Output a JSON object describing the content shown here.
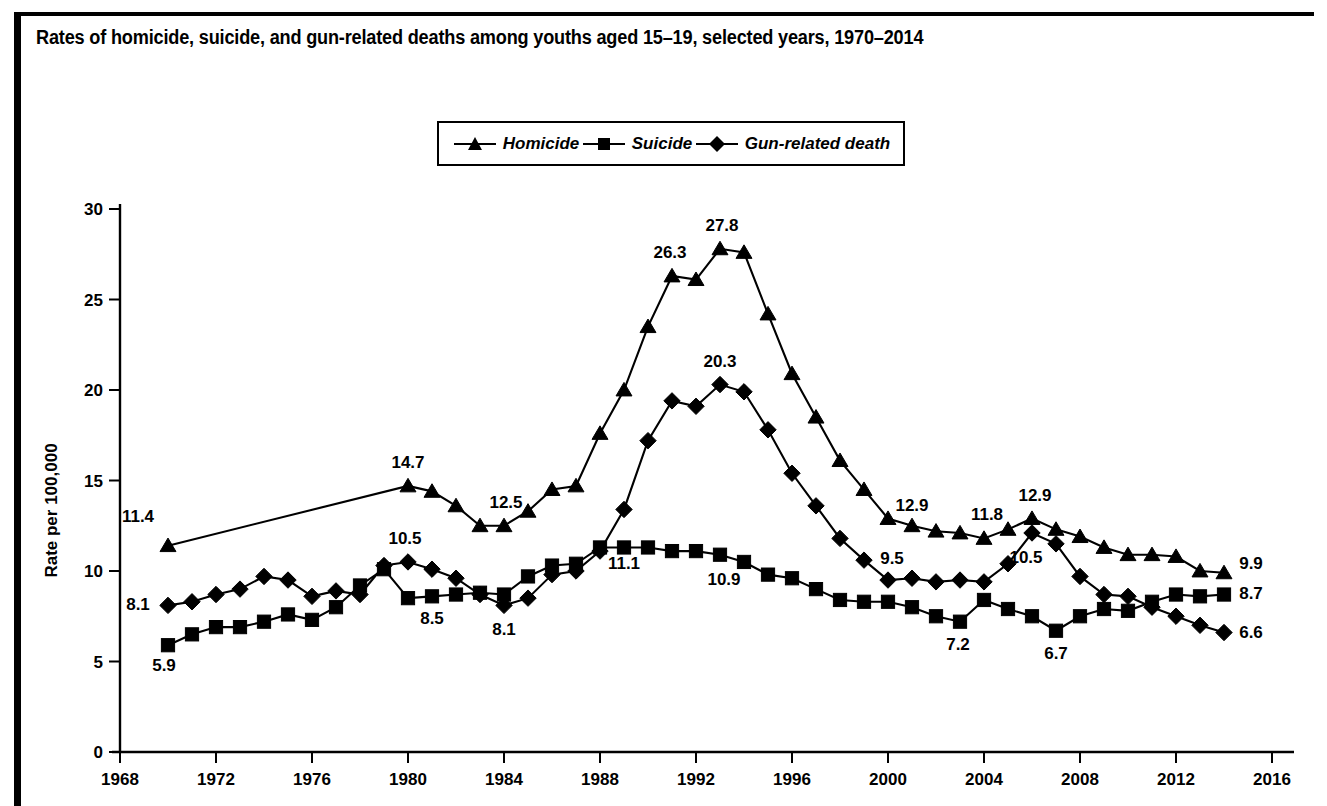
{
  "figure": {
    "title": "Rates of homicide, suicide, and gun-related deaths among youths aged 15–19, selected years, 1970–2014"
  },
  "legend": {
    "position": "top-center",
    "entries": [
      {
        "label": "Homicide",
        "marker": "triangle-icon"
      },
      {
        "label": "Suicide",
        "marker": "square-icon"
      },
      {
        "label": "Gun-related death",
        "marker": "diamond-icon"
      }
    ]
  },
  "chart_data": {
    "type": "line",
    "title": "Rates of homicide, suicide, and gun-related deaths among youths aged 15–19, selected years, 1970–2014",
    "xlabel": "",
    "ylabel": "Rate per 100,000",
    "xlim": [
      1968,
      2016
    ],
    "ylim": [
      0,
      30
    ],
    "xticks": [
      1968,
      1972,
      1976,
      1980,
      1984,
      1988,
      1992,
      1996,
      2000,
      2004,
      2008,
      2012,
      2016
    ],
    "yticks": [
      0,
      5,
      10,
      15,
      20,
      25,
      30
    ],
    "grid": false,
    "series": [
      {
        "name": "Homicide",
        "marker": "triangle",
        "x": [
          1970,
          1980,
          1981,
          1982,
          1983,
          1984,
          1985,
          1986,
          1987,
          1988,
          1989,
          1990,
          1991,
          1992,
          1993,
          1994,
          1995,
          1996,
          1997,
          1998,
          1999,
          2000,
          2001,
          2002,
          2003,
          2004,
          2005,
          2006,
          2007,
          2008,
          2009,
          2010,
          2011,
          2012,
          2013,
          2014
        ],
        "values": [
          11.4,
          14.7,
          14.4,
          13.6,
          12.5,
          12.5,
          13.3,
          14.5,
          14.7,
          17.6,
          20.0,
          23.5,
          26.3,
          26.1,
          27.8,
          27.6,
          24.2,
          20.9,
          18.5,
          16.1,
          14.5,
          12.9,
          12.5,
          12.2,
          12.1,
          11.8,
          12.3,
          12.9,
          12.3,
          11.9,
          11.3,
          10.9,
          10.9,
          10.8,
          10.0,
          9.9
        ]
      },
      {
        "name": "Suicide",
        "marker": "square",
        "x": [
          1970,
          1971,
          1972,
          1973,
          1974,
          1975,
          1976,
          1977,
          1978,
          1979,
          1980,
          1981,
          1982,
          1983,
          1984,
          1985,
          1986,
          1987,
          1988,
          1989,
          1990,
          1991,
          1992,
          1993,
          1994,
          1995,
          1996,
          1997,
          1998,
          1999,
          2000,
          2001,
          2002,
          2003,
          2004,
          2005,
          2006,
          2007,
          2008,
          2009,
          2010,
          2011,
          2012,
          2013,
          2014
        ],
        "values": [
          5.9,
          6.5,
          6.9,
          6.9,
          7.2,
          7.6,
          7.3,
          8.0,
          9.2,
          10.1,
          8.5,
          8.6,
          8.7,
          8.8,
          8.7,
          9.7,
          10.3,
          10.4,
          11.3,
          11.3,
          11.3,
          11.1,
          11.1,
          10.9,
          10.5,
          9.8,
          9.6,
          9.0,
          8.4,
          8.3,
          8.3,
          8.0,
          7.5,
          7.2,
          8.4,
          7.9,
          7.5,
          6.7,
          7.5,
          7.9,
          7.8,
          8.3,
          8.7,
          8.6,
          8.7
        ]
      },
      {
        "name": "Gun-related death",
        "marker": "diamond",
        "x": [
          1970,
          1971,
          1972,
          1973,
          1974,
          1975,
          1976,
          1977,
          1978,
          1979,
          1980,
          1981,
          1982,
          1983,
          1984,
          1985,
          1986,
          1987,
          1988,
          1989,
          1990,
          1991,
          1992,
          1993,
          1994,
          1995,
          1996,
          1997,
          1998,
          1999,
          2000,
          2001,
          2002,
          2003,
          2004,
          2005,
          2006,
          2007,
          2008,
          2009,
          2010,
          2011,
          2012,
          2013,
          2014
        ],
        "values": [
          8.1,
          8.3,
          8.7,
          9.0,
          9.7,
          9.5,
          8.6,
          8.9,
          8.7,
          10.3,
          10.5,
          10.1,
          9.6,
          8.7,
          8.1,
          8.5,
          9.8,
          10.0,
          11.1,
          13.4,
          17.2,
          19.4,
          19.1,
          20.3,
          19.9,
          17.8,
          15.4,
          13.6,
          11.8,
          10.6,
          9.5,
          9.6,
          9.4,
          9.5,
          9.4,
          10.4,
          12.1,
          11.5,
          9.7,
          8.7,
          8.6,
          8.0,
          7.5,
          7.0,
          6.6
        ]
      }
    ],
    "annotations": [
      {
        "series": "Homicide",
        "x": 1970,
        "value": 11.4,
        "text": "11.4",
        "dx": -30,
        "dy": -24
      },
      {
        "series": "Homicide",
        "x": 1980,
        "value": 14.7,
        "text": "14.7",
        "dx": 0,
        "dy": -18
      },
      {
        "series": "Homicide",
        "x": 1984,
        "value": 12.5,
        "text": "12.5",
        "dx": 2,
        "dy": -18
      },
      {
        "series": "Homicide",
        "x": 1991,
        "value": 26.3,
        "text": "26.3",
        "dx": -2,
        "dy": -18
      },
      {
        "series": "Homicide",
        "x": 1993,
        "value": 27.8,
        "text": "27.8",
        "dx": 2,
        "dy": -18
      },
      {
        "series": "Homicide",
        "x": 2000,
        "value": 12.9,
        "text": "12.9",
        "dx": 24,
        "dy": -8
      },
      {
        "series": "Homicide",
        "x": 2004,
        "value": 11.8,
        "text": "11.8",
        "dx": 3,
        "dy": -18
      },
      {
        "series": "Homicide",
        "x": 2006,
        "value": 12.9,
        "text": "12.9",
        "dx": 3,
        "dy": -18
      },
      {
        "series": "Homicide",
        "x": 2014,
        "value": 9.9,
        "text": "9.9",
        "dx": 27,
        "dy": -4
      },
      {
        "series": "Suicide",
        "x": 1970,
        "value": 5.9,
        "text": "5.9",
        "dx": -4,
        "dy": 26
      },
      {
        "series": "Suicide",
        "x": 1981,
        "value": 8.6,
        "text": "8.5",
        "dx": 0,
        "dy": 28
      },
      {
        "series": "Suicide",
        "x": 1993,
        "value": 10.9,
        "text": "10.9",
        "dx": 4,
        "dy": 30
      },
      {
        "series": "Suicide",
        "x": 2003,
        "value": 7.2,
        "text": "7.2",
        "dx": -2,
        "dy": 28
      },
      {
        "series": "Suicide",
        "x": 2007,
        "value": 6.7,
        "text": "6.7",
        "dx": 0,
        "dy": 28
      },
      {
        "series": "Suicide",
        "x": 2014,
        "value": 8.7,
        "text": "8.7",
        "dx": 27,
        "dy": 4
      },
      {
        "series": "Gun-related death",
        "x": 1970,
        "value": 8.1,
        "text": "8.1",
        "dx": -30,
        "dy": 5
      },
      {
        "series": "Gun-related death",
        "x": 1980,
        "value": 10.5,
        "text": "10.5",
        "dx": -3,
        "dy": -18
      },
      {
        "series": "Gun-related death",
        "x": 1984,
        "value": 8.1,
        "text": "8.1",
        "dx": 0,
        "dy": 30
      },
      {
        "series": "Gun-related death",
        "x": 1988,
        "value": 11.1,
        "text": "11.1",
        "dx": 24,
        "dy": 18
      },
      {
        "series": "Gun-related death",
        "x": 1993,
        "value": 20.3,
        "text": "20.3",
        "dx": 0,
        "dy": -18
      },
      {
        "series": "Gun-related death",
        "x": 2000,
        "value": 9.5,
        "text": "9.5",
        "dx": 4,
        "dy": -16
      },
      {
        "series": "Gun-related death",
        "x": 2006,
        "value": 12.1,
        "text": "10.5",
        "dx": -6,
        "dy": 30
      },
      {
        "series": "Gun-related death",
        "x": 2014,
        "value": 6.6,
        "text": "6.6",
        "dx": 27,
        "dy": 5
      }
    ]
  }
}
